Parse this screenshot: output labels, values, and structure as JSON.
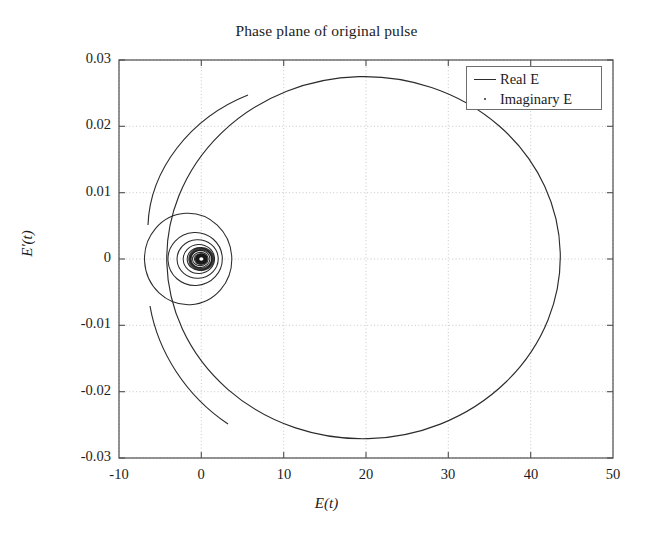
{
  "chart_data": {
    "type": "line",
    "title": "Phase plane of original pulse",
    "xlabel": "E(t)",
    "ylabel": "E'(t)",
    "xlim": [
      -10,
      50
    ],
    "ylim": [
      -0.03,
      0.03
    ],
    "xticks": [
      "-10",
      "0",
      "10",
      "20",
      "30",
      "40",
      "50"
    ],
    "xtick_values": [
      -10,
      0,
      10,
      20,
      30,
      40,
      50
    ],
    "yticks": [
      "0.03",
      "0.02",
      "0.01",
      "0",
      "-0.01",
      "-0.02",
      "-0.03"
    ],
    "ytick_values": [
      0.03,
      0.02,
      0.01,
      0,
      -0.01,
      -0.02,
      -0.03
    ],
    "grid": true,
    "grid_style": "dotted",
    "legend_position": "upper right",
    "legend": [
      {
        "label": "Real E",
        "marker": "line",
        "color": "#2b2b2b"
      },
      {
        "label": "Imaginary E",
        "marker": "dot",
        "color": "#2b2b2b"
      }
    ],
    "series": [
      {
        "name": "Real E",
        "type": "spiral",
        "center": [
          0,
          0
        ],
        "loops": [
          {
            "cx": 19.7,
            "cy": 0.0002,
            "rx": 23.9,
            "ry": 0.0273,
            "rot": -1.5
          },
          {
            "cx": -1.6,
            "cy": 0.0,
            "rx": 5.3,
            "ry": 0.0069,
            "rot": -3.0
          },
          {
            "cx": -0.75,
            "cy": 0.0,
            "rx": 3.3,
            "ry": 0.004,
            "rot": -3.0
          },
          {
            "cx": -0.45,
            "cy": 0.0,
            "rx": 2.5,
            "ry": 0.0029,
            "rot": -3.0
          },
          {
            "cx": -0.3,
            "cy": 0.0,
            "rx": 1.9,
            "ry": 0.0022,
            "rot": -3.0
          },
          {
            "cx": -0.22,
            "cy": 0.0,
            "rx": 1.5,
            "ry": 0.0017,
            "rot": -3.0
          },
          {
            "cx": -0.16,
            "cy": 0.0,
            "rx": 1.2,
            "ry": 0.0013,
            "rot": -3.0
          },
          {
            "cx": -0.12,
            "cy": 0.0,
            "rx": 0.95,
            "ry": 0.001,
            "rot": -3.0
          },
          {
            "cx": -0.09,
            "cy": 0.0,
            "rx": 0.75,
            "ry": 0.0008,
            "rot": -3.0
          },
          {
            "cx": -0.07,
            "cy": 0.0,
            "rx": 0.58,
            "ry": 0.00062,
            "rot": -3.0
          },
          {
            "cx": -0.05,
            "cy": 0.0,
            "rx": 0.45,
            "ry": 0.00048,
            "rot": -3.0
          },
          {
            "cx": -0.04,
            "cy": 0.0,
            "rx": 0.35,
            "ry": 0.00037,
            "rot": -3.0
          },
          {
            "cx": -0.03,
            "cy": 0.0,
            "rx": 0.27,
            "ry": 0.00029,
            "rot": -3.0
          },
          {
            "cx": -0.02,
            "cy": 0.0,
            "rx": 0.21,
            "ry": 0.00022,
            "rot": -3.0
          }
        ],
        "extents": {
          "x_max": 43.6,
          "x_min": -7.0,
          "y_max": 0.0273,
          "y_min": -0.0275
        }
      },
      {
        "name": "Imaginary E",
        "type": "spiral",
        "note": "Overlaps the Real E trace; drawn as a dotted overlay along the same orbit."
      }
    ]
  }
}
